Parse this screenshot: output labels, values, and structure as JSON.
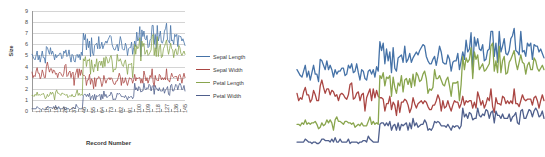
{
  "chart_data": {
    "type": "line",
    "title": "",
    "xlabel": "Record Number",
    "ylabel": "Size",
    "ylim": [
      0,
      9
    ],
    "xlim": [
      1,
      150
    ],
    "grid": true,
    "legend_position": "right",
    "x_tick_labels": [
      "1",
      "10",
      "19",
      "28",
      "37",
      "46",
      "55",
      "64",
      "73",
      "82",
      "91",
      "100",
      "109",
      "118",
      "127",
      "136",
      "145"
    ],
    "y_tick_labels": [
      "0",
      "1",
      "2",
      "3",
      "4",
      "5",
      "6",
      "7",
      "8",
      "9"
    ],
    "colors": {
      "sepal_length": "#4572A7",
      "sepal_width": "#AA4643",
      "petal_length": "#89A54E",
      "petal_width": "#4F5F8C"
    },
    "series": [
      {
        "name": "Sepal Length",
        "color": "#4572A7",
        "values": [
          5.1,
          4.9,
          4.7,
          4.6,
          5.0,
          5.4,
          4.6,
          5.0,
          4.4,
          4.9,
          5.4,
          4.8,
          4.8,
          4.3,
          5.8,
          5.7,
          5.4,
          5.1,
          5.7,
          5.1,
          5.4,
          5.1,
          4.6,
          5.1,
          4.8,
          5.0,
          5.0,
          5.2,
          5.2,
          4.7,
          4.8,
          5.4,
          5.2,
          5.5,
          4.9,
          5.0,
          5.5,
          4.9,
          4.4,
          5.1,
          5.0,
          4.5,
          4.4,
          5.0,
          5.1,
          4.8,
          5.1,
          4.6,
          5.3,
          5.0,
          7.0,
          6.4,
          6.9,
          5.5,
          6.5,
          5.7,
          6.3,
          4.9,
          6.6,
          5.2,
          5.0,
          5.9,
          6.0,
          6.1,
          5.6,
          6.7,
          5.6,
          5.8,
          6.2,
          5.6,
          5.9,
          6.1,
          6.3,
          6.1,
          6.4,
          6.6,
          6.8,
          6.7,
          6.0,
          5.7,
          5.5,
          5.5,
          5.8,
          6.0,
          5.4,
          6.0,
          6.7,
          6.3,
          5.6,
          5.5,
          5.5,
          6.1,
          5.8,
          5.0,
          5.6,
          5.7,
          5.7,
          6.2,
          5.1,
          5.7,
          6.3,
          5.8,
          7.1,
          6.3,
          6.5,
          7.6,
          4.9,
          7.3,
          6.7,
          7.2,
          6.5,
          6.4,
          6.8,
          5.7,
          5.8,
          6.4,
          6.5,
          7.7,
          7.7,
          6.0,
          6.9,
          5.6,
          7.7,
          6.3,
          6.7,
          7.2,
          6.2,
          6.1,
          6.4,
          7.2,
          7.4,
          7.9,
          6.4,
          6.3,
          6.1,
          7.7,
          6.3,
          6.4,
          6.0,
          6.9,
          6.7,
          6.9,
          5.8,
          6.8,
          6.7,
          6.7,
          6.3,
          6.5,
          6.2,
          5.9
        ]
      },
      {
        "name": "Sepal Width",
        "color": "#AA4643",
        "values": [
          3.5,
          3.0,
          3.2,
          3.1,
          3.6,
          3.9,
          3.4,
          3.4,
          2.9,
          3.1,
          3.7,
          3.4,
          3.0,
          3.0,
          4.0,
          4.4,
          3.9,
          3.5,
          3.8,
          3.8,
          3.4,
          3.7,
          3.6,
          3.3,
          3.4,
          3.0,
          3.4,
          3.5,
          3.4,
          3.2,
          3.1,
          3.4,
          4.1,
          4.2,
          3.1,
          3.2,
          3.5,
          3.6,
          3.0,
          3.4,
          3.5,
          2.3,
          3.2,
          3.5,
          3.8,
          3.0,
          3.8,
          3.2,
          3.7,
          3.3,
          3.2,
          3.2,
          3.1,
          2.3,
          2.8,
          2.8,
          3.3,
          2.4,
          2.9,
          2.7,
          2.0,
          3.0,
          2.2,
          2.9,
          2.9,
          3.1,
          3.0,
          2.7,
          2.2,
          2.5,
          3.2,
          2.8,
          2.5,
          2.8,
          2.9,
          3.0,
          2.8,
          3.0,
          2.9,
          2.6,
          2.4,
          2.4,
          2.7,
          2.7,
          3.0,
          3.4,
          3.1,
          2.3,
          3.0,
          2.5,
          2.6,
          3.0,
          2.6,
          2.3,
          2.7,
          3.0,
          2.9,
          2.9,
          2.5,
          2.8,
          3.3,
          2.7,
          3.0,
          2.9,
          3.0,
          3.0,
          2.5,
          2.9,
          2.5,
          3.6,
          3.2,
          2.7,
          3.0,
          2.5,
          2.8,
          3.2,
          3.0,
          3.8,
          2.6,
          2.2,
          3.2,
          2.8,
          2.8,
          2.7,
          3.3,
          3.2,
          2.8,
          3.0,
          2.8,
          3.0,
          2.8,
          3.8,
          2.8,
          2.8,
          2.6,
          3.0,
          3.4,
          3.1,
          3.0,
          3.1,
          3.1,
          3.1,
          2.7,
          3.2,
          3.3,
          3.0,
          2.5,
          3.0,
          3.4,
          3.0
        ]
      },
      {
        "name": "Petal Length",
        "color": "#89A54E",
        "values": [
          1.4,
          1.4,
          1.3,
          1.5,
          1.4,
          1.7,
          1.4,
          1.5,
          1.4,
          1.5,
          1.5,
          1.6,
          1.4,
          1.1,
          1.2,
          1.5,
          1.3,
          1.4,
          1.7,
          1.5,
          1.7,
          1.5,
          1.0,
          1.7,
          1.9,
          1.6,
          1.6,
          1.5,
          1.4,
          1.6,
          1.6,
          1.5,
          1.5,
          1.4,
          1.5,
          1.2,
          1.3,
          1.4,
          1.3,
          1.5,
          1.3,
          1.3,
          1.3,
          1.6,
          1.9,
          1.4,
          1.6,
          1.4,
          1.5,
          1.4,
          4.7,
          4.5,
          4.9,
          4.0,
          4.6,
          4.5,
          4.7,
          3.3,
          4.6,
          3.9,
          3.5,
          4.2,
          4.0,
          4.7,
          3.6,
          4.4,
          4.5,
          4.1,
          4.5,
          3.9,
          4.8,
          4.0,
          4.9,
          4.7,
          4.3,
          4.4,
          4.8,
          5.0,
          4.5,
          3.5,
          3.8,
          3.7,
          3.9,
          5.1,
          4.5,
          4.5,
          4.7,
          4.4,
          4.1,
          4.0,
          4.4,
          4.6,
          4.0,
          3.3,
          4.2,
          4.2,
          4.2,
          4.3,
          3.0,
          4.1,
          6.0,
          5.1,
          5.9,
          5.6,
          5.8,
          6.6,
          4.5,
          6.3,
          5.8,
          6.1,
          5.1,
          5.3,
          5.5,
          5.0,
          5.1,
          5.3,
          5.5,
          6.7,
          6.9,
          5.0,
          5.7,
          4.9,
          6.7,
          4.9,
          5.7,
          6.0,
          4.8,
          4.9,
          5.6,
          5.8,
          6.1,
          6.4,
          5.6,
          5.1,
          5.6,
          6.1,
          5.6,
          5.5,
          4.8,
          5.4,
          5.6,
          5.1,
          5.1,
          5.9,
          5.7,
          5.2,
          5.0,
          5.2,
          5.4,
          5.1
        ]
      },
      {
        "name": "Petal Width",
        "color": "#4F5F8C",
        "values": [
          0.2,
          0.2,
          0.2,
          0.2,
          0.2,
          0.4,
          0.3,
          0.2,
          0.2,
          0.1,
          0.2,
          0.2,
          0.1,
          0.1,
          0.2,
          0.4,
          0.4,
          0.3,
          0.3,
          0.3,
          0.2,
          0.4,
          0.2,
          0.5,
          0.2,
          0.2,
          0.4,
          0.2,
          0.2,
          0.2,
          0.2,
          0.4,
          0.1,
          0.2,
          0.2,
          0.2,
          0.2,
          0.1,
          0.2,
          0.2,
          0.3,
          0.3,
          0.2,
          0.6,
          0.4,
          0.3,
          0.2,
          0.2,
          0.2,
          0.2,
          1.4,
          1.5,
          1.5,
          1.3,
          1.5,
          1.3,
          1.6,
          1.0,
          1.3,
          1.4,
          1.0,
          1.5,
          1.0,
          1.4,
          1.3,
          1.4,
          1.5,
          1.0,
          1.5,
          1.1,
          1.8,
          1.3,
          1.5,
          1.2,
          1.3,
          1.4,
          1.4,
          1.7,
          1.5,
          1.0,
          1.1,
          1.0,
          1.2,
          1.6,
          1.5,
          1.6,
          1.5,
          1.3,
          1.3,
          1.3,
          1.2,
          1.4,
          1.2,
          1.0,
          1.3,
          1.2,
          1.3,
          1.3,
          1.1,
          1.3,
          2.5,
          1.9,
          2.1,
          1.8,
          2.2,
          2.1,
          1.7,
          1.8,
          1.8,
          2.5,
          2.0,
          1.9,
          2.1,
          2.0,
          2.4,
          2.3,
          1.8,
          2.2,
          2.3,
          1.5,
          2.3,
          2.0,
          2.0,
          1.8,
          2.1,
          1.8,
          1.8,
          1.8,
          2.1,
          1.6,
          1.9,
          2.0,
          2.2,
          1.5,
          1.4,
          2.3,
          2.4,
          1.8,
          1.8,
          2.1,
          2.4,
          2.3,
          1.9,
          2.3,
          2.5,
          2.3,
          1.9,
          2.0,
          2.3,
          1.8
        ]
      }
    ]
  },
  "left_panel": {
    "axis_title_y": "Size",
    "axis_title_x": "Record Number"
  },
  "legend": {
    "items": [
      {
        "label": "Sepal Length",
        "color": "#4572A7"
      },
      {
        "label": "Sepal Width",
        "color": "#AA4643"
      },
      {
        "label": "Petal Length",
        "color": "#89A54E"
      },
      {
        "label": "Petal Width",
        "color": "#4F5F8C"
      }
    ]
  }
}
